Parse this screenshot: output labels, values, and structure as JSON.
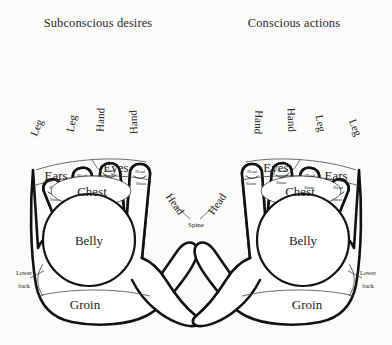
{
  "page": {
    "background_color": "#fbfbfa",
    "ink_color": "#111111",
    "text_color": "#222222"
  },
  "headings": {
    "left": "Subconscious desires",
    "right": "Conscious actions"
  },
  "fingertip_label": {
    "top": "Head",
    "bottom": "Sinus"
  },
  "hands": [
    {
      "id": "left-hand",
      "side": "left",
      "heading": "Subconscious desires",
      "fingers": [
        {
          "name": "pinky",
          "label": "Leg",
          "tip_top": "Head",
          "tip_bottom": "Sinus"
        },
        {
          "name": "ring",
          "label": "Leg",
          "tip_top": "Head",
          "tip_bottom": "Sinus"
        },
        {
          "name": "middle",
          "label": "Hand",
          "tip_top": "Head",
          "tip_bottom": "Sinus"
        },
        {
          "name": "index",
          "label": "Hand",
          "tip_top": "Head",
          "tip_bottom": "Sinus"
        }
      ],
      "thumb": {
        "label": "Head"
      },
      "palm_zones": [
        {
          "name": "ears",
          "label": "Ears"
        },
        {
          "name": "eyes",
          "label": "Eyes"
        },
        {
          "name": "chest",
          "label": "Chest"
        },
        {
          "name": "belly",
          "label": "Belly"
        },
        {
          "name": "groin",
          "label": "Groin"
        },
        {
          "name": "lower-back",
          "label": "Lower back",
          "line1": "Lower",
          "line2": "back"
        }
      ]
    },
    {
      "id": "right-hand",
      "side": "right",
      "heading": "Conscious actions",
      "fingers": [
        {
          "name": "index",
          "label": "Hand",
          "tip_top": "Head",
          "tip_bottom": "Sinus"
        },
        {
          "name": "middle",
          "label": "Hand",
          "tip_top": "Head",
          "tip_bottom": "Sinus"
        },
        {
          "name": "ring",
          "label": "Leg",
          "tip_top": "Head",
          "tip_bottom": "Sinus"
        },
        {
          "name": "pinky",
          "label": "Leg",
          "tip_top": "Head",
          "tip_bottom": "Sinus"
        }
      ],
      "thumb": {
        "label": "Head"
      },
      "palm_zones": [
        {
          "name": "eyes",
          "label": "Eyes"
        },
        {
          "name": "ears",
          "label": "Ears"
        },
        {
          "name": "chest",
          "label": "Chest"
        },
        {
          "name": "belly",
          "label": "Belly"
        },
        {
          "name": "groin",
          "label": "Groin"
        },
        {
          "name": "lower-back",
          "label": "Lower back",
          "line1": "Lower",
          "line2": "back"
        }
      ]
    }
  ],
  "center": {
    "spine_label": "Spine"
  }
}
